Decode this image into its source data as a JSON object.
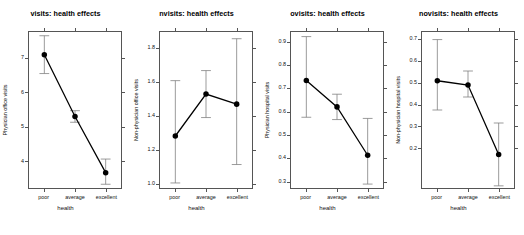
{
  "figure": {
    "background": "#ffffff",
    "panel_count": 4,
    "point_color": "#000000",
    "line_color": "#000000",
    "errorbar_color": "#808080",
    "axis_color": "#555555"
  },
  "chart_data": [
    {
      "type": "line",
      "title": "visits: health effects",
      "xlabel": "health",
      "ylabel": "Physician office visits",
      "categories": [
        "poor",
        "average",
        "excellent"
      ],
      "values": [
        7.11,
        5.3,
        3.65
      ],
      "err_low": [
        6.56,
        5.13,
        3.31
      ],
      "err_high": [
        7.67,
        5.47,
        4.05
      ],
      "yticks": [
        4,
        5,
        6,
        7
      ],
      "ytick_labels": [
        "4",
        "5",
        "6",
        "7"
      ],
      "ylim": [
        3.2,
        7.78
      ],
      "grid": false,
      "legend": "none"
    },
    {
      "type": "line",
      "title": "nvisits: health effects",
      "xlabel": "health",
      "ylabel": "Non-physician office visits",
      "categories": [
        "poor",
        "average",
        "excellent"
      ],
      "values": [
        1.28,
        1.53,
        1.47
      ],
      "err_low": [
        1.0,
        1.39,
        1.11
      ],
      "err_high": [
        1.61,
        1.67,
        1.86
      ],
      "yticks": [
        1.0,
        1.2,
        1.4,
        1.6,
        1.8
      ],
      "ytick_labels": [
        "1.0",
        "1.2",
        "1.4",
        "1.6",
        "1.8"
      ],
      "ylim": [
        0.97,
        1.9
      ],
      "grid": false,
      "legend": "none"
    },
    {
      "type": "line",
      "title": "ovisits: health effects",
      "xlabel": "health",
      "ylabel": "Physician hospital visits",
      "categories": [
        "poor",
        "average",
        "excellent"
      ],
      "values": [
        0.735,
        0.62,
        0.41
      ],
      "err_low": [
        0.575,
        0.565,
        0.285
      ],
      "err_high": [
        0.925,
        0.675,
        0.57
      ],
      "yticks": [
        0.3,
        0.4,
        0.5,
        0.6,
        0.7,
        0.8,
        0.9
      ],
      "ytick_labels": [
        "0.3",
        "0.4",
        "0.5",
        "0.6",
        "0.7",
        "0.8",
        "0.9"
      ],
      "ylim": [
        0.268,
        0.945
      ],
      "grid": false,
      "legend": "none"
    },
    {
      "type": "line",
      "title": "novisits: health effects",
      "xlabel": "health",
      "ylabel": "Non-physician hospital visits",
      "categories": [
        "poor",
        "average",
        "excellent"
      ],
      "values": [
        0.51,
        0.49,
        0.17
      ],
      "err_low": [
        0.375,
        0.435,
        0.025
      ],
      "err_high": [
        0.7,
        0.555,
        0.315
      ],
      "yticks": [
        0.2,
        0.3,
        0.4,
        0.5,
        0.6,
        0.7
      ],
      "ytick_labels": [
        "0.2",
        "0.3",
        "0.4",
        "0.5",
        "0.6",
        "0.7"
      ],
      "ylim": [
        0.015,
        0.735
      ],
      "grid": false,
      "legend": "none"
    }
  ]
}
